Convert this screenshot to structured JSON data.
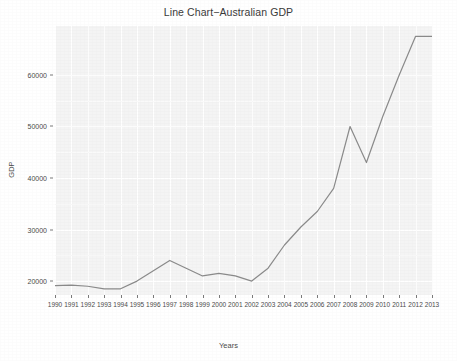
{
  "chart_data": {
    "type": "line",
    "title": "Line Chart−Australian GDP",
    "xlabel": "Years",
    "ylabel": "GDP",
    "grid": true,
    "legend": null,
    "x": [
      1990,
      1991,
      1992,
      1993,
      1994,
      1995,
      1996,
      1997,
      1998,
      1999,
      2000,
      2001,
      2002,
      2003,
      2004,
      2005,
      2006,
      2007,
      2008,
      2009,
      2010,
      2011,
      2012,
      2013
    ],
    "categories": [
      "1990",
      "1991",
      "1992",
      "1993",
      "1994",
      "1995",
      "1996",
      "1997",
      "1998",
      "1999",
      "2000",
      "2001",
      "2002",
      "2003",
      "2004",
      "2005",
      "2006",
      "2007",
      "2008",
      "2009",
      "2010",
      "2011",
      "2012",
      "2013"
    ],
    "values": [
      19100,
      19200,
      19000,
      18500,
      18500,
      20000,
      22000,
      24000,
      22500,
      21000,
      21500,
      21000,
      20000,
      22500,
      27000,
      30500,
      33500,
      38000,
      50000,
      43000,
      52000,
      60000,
      67500,
      67500
    ],
    "series": [
      {
        "name": "Australian GDP",
        "values": [
          19100,
          19200,
          19000,
          18500,
          18500,
          20000,
          22000,
          24000,
          22500,
          21000,
          21500,
          21000,
          20000,
          22500,
          27000,
          30500,
          33500,
          38000,
          50000,
          43000,
          52000,
          60000,
          67500,
          67500
        ]
      }
    ],
    "xlim": [
      1990,
      2013
    ],
    "ylim": [
      17300,
      69500
    ],
    "yticks": [
      20000,
      30000,
      40000,
      50000,
      60000
    ],
    "ytick_labels": [
      "20000",
      "30000",
      "40000",
      "50000",
      "60000"
    ],
    "line_color": "#8a8a8a",
    "panel_color": "#f4f4f4",
    "grid_color": "#ffffff",
    "text_color": "#4a4a4a"
  }
}
